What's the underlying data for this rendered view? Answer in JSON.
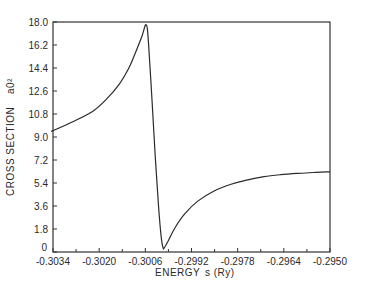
{
  "chart_data": {
    "type": "line",
    "title": "",
    "xlabel": "ENERGY",
    "xlabel_unit": "s (Ry)",
    "ylabel": "CROSS SECTION",
    "ylabel_unit": "a0²",
    "xlim": [
      -0.3034,
      -0.295
    ],
    "ylim": [
      0,
      18.0
    ],
    "grid": false,
    "legend": null,
    "x_ticks": [
      -0.3034,
      -0.302,
      -0.3006,
      -0.2992,
      -0.2978,
      -0.2964,
      -0.295
    ],
    "x_tick_labels": [
      "-0.3034",
      "-0.3020",
      "-0.3006",
      "-0.2992",
      "-0.2978",
      "-0.2964",
      "-0.2950"
    ],
    "y_ticks": [
      0,
      1.8,
      3.6,
      5.4,
      7.2,
      9.0,
      10.8,
      12.6,
      14.4,
      16.2,
      18.0
    ],
    "y_tick_labels": [
      "0",
      "1.8",
      "3.6",
      "5.4",
      "7.2",
      "9.0",
      "10.8",
      "12.6",
      "14.4",
      "16.2",
      "18.0"
    ],
    "series": [
      {
        "name": "cross section",
        "x": [
          -0.3034,
          -0.3028,
          -0.3022,
          -0.3018,
          -0.3014,
          -0.3011,
          -0.3009,
          -0.3007,
          -0.30062,
          -0.30058,
          -0.30054,
          -0.3005,
          -0.3004,
          -0.3003,
          -0.3002,
          -0.30012,
          -0.30006,
          -0.30002,
          -0.2999,
          -0.2997,
          -0.2994,
          -0.299,
          -0.2985,
          -0.298,
          -0.2975,
          -0.297,
          -0.2965,
          -0.296,
          -0.2955,
          -0.2951
        ],
        "values": [
          9.5,
          10.2,
          11.0,
          11.9,
          13.1,
          14.4,
          15.6,
          16.9,
          17.6,
          17.8,
          17.5,
          16.2,
          12.0,
          7.5,
          3.6,
          1.2,
          0.3,
          0.35,
          0.9,
          1.9,
          3.0,
          4.0,
          4.8,
          5.3,
          5.65,
          5.9,
          6.05,
          6.15,
          6.22,
          6.27
        ]
      }
    ]
  },
  "plot": {
    "left_px": 53,
    "top_px": 22,
    "right_px": 330,
    "bottom_px": 252,
    "line_color": "#2a2a2a",
    "frame_color": "#333333"
  }
}
